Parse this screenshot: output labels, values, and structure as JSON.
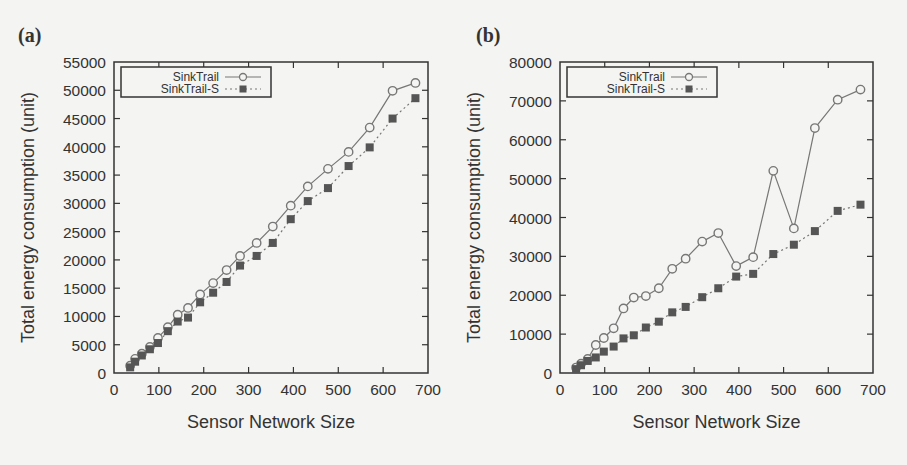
{
  "chart_data": [
    {
      "panel_label": "(a)",
      "type": "line",
      "title": "",
      "xlabel": "Sensor Network Size",
      "ylabel": "Total energy consumption (unit)",
      "xlim": [
        0,
        700
      ],
      "ylim": [
        0,
        55000
      ],
      "xticks": [
        0,
        100,
        200,
        300,
        400,
        500,
        600,
        700
      ],
      "yticks": [
        0,
        5000,
        10000,
        15000,
        20000,
        25000,
        30000,
        35000,
        40000,
        45000,
        50000,
        55000
      ],
      "grid": false,
      "legend_position": "top-left",
      "x": [
        36,
        47,
        62,
        80,
        98,
        120,
        142,
        165,
        192,
        221,
        251,
        281,
        318,
        354,
        394,
        432,
        477,
        523,
        570,
        621,
        672
      ],
      "series": [
        {
          "name": "SinkTrail",
          "marker": "circle-open",
          "line": "solid",
          "values": [
            1300,
            2500,
            3400,
            4600,
            6200,
            8100,
            10300,
            11500,
            13900,
            15900,
            18200,
            20700,
            23000,
            25900,
            29600,
            33000,
            36100,
            39100,
            43400,
            49900,
            51300
          ]
        },
        {
          "name": "SinkTrail-S",
          "marker": "square-filled",
          "line": "dotted",
          "values": [
            1000,
            2000,
            3100,
            4200,
            5300,
            7400,
            9100,
            9800,
            12500,
            14200,
            16100,
            19000,
            20700,
            23000,
            27200,
            30400,
            32700,
            36600,
            39900,
            45000,
            48600
          ]
        }
      ]
    },
    {
      "panel_label": "(b)",
      "type": "line",
      "title": "",
      "xlabel": "Sensor Network Size",
      "ylabel": "Total energy consumption (unit)",
      "xlim": [
        0,
        700
      ],
      "ylim": [
        0,
        80000
      ],
      "xticks": [
        0,
        100,
        200,
        300,
        400,
        500,
        600,
        700
      ],
      "yticks": [
        0,
        10000,
        20000,
        30000,
        40000,
        50000,
        60000,
        70000,
        80000
      ],
      "grid": false,
      "legend_position": "top-left",
      "x": [
        36,
        47,
        62,
        80,
        98,
        120,
        142,
        165,
        192,
        221,
        251,
        281,
        318,
        354,
        394,
        432,
        477,
        523,
        570,
        621,
        672
      ],
      "series": [
        {
          "name": "SinkTrail",
          "marker": "circle-open",
          "line": "solid",
          "values": [
            1400,
            2400,
            3600,
            7200,
            9000,
            11500,
            16600,
            19400,
            19800,
            21800,
            26800,
            29400,
            33800,
            36000,
            27500,
            29800,
            52000,
            37200,
            63000,
            70300,
            72900
          ]
        },
        {
          "name": "SinkTrail-S",
          "marker": "square-filled",
          "line": "dotted",
          "values": [
            1000,
            2000,
            3100,
            4000,
            5500,
            6800,
            8900,
            9700,
            11700,
            13200,
            15600,
            17000,
            19500,
            21800,
            24800,
            25500,
            30600,
            33000,
            36500,
            41700,
            43300
          ]
        }
      ]
    }
  ],
  "panels": [
    {
      "label": "(a)",
      "xlabel": "Sensor Network Size",
      "ylabel": "Total energy consumption (unit)",
      "legend": [
        "SinkTrail",
        "SinkTrail-S"
      ]
    },
    {
      "label": "(b)",
      "xlabel": "Sensor Network Size",
      "ylabel": "Total energy consumption (unit)",
      "legend": [
        "SinkTrail",
        "SinkTrail-S"
      ]
    }
  ],
  "colors": {
    "line": "#777777",
    "marker_fill": "#555555",
    "axis": "#333333",
    "background": "#f4f4f2"
  }
}
